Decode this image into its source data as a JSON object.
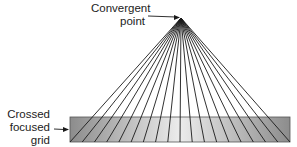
{
  "labels": {
    "convergent_line1": "Convergent",
    "convergent_line2": "point",
    "grid_line1": "Crossed",
    "grid_line2": "focused",
    "grid_line3": "grid"
  },
  "geometry": {
    "apex": [
      181,
      18
    ],
    "grid_rect": {
      "x": 70,
      "y": 117,
      "width": 220,
      "height": 25
    },
    "line_count": 19
  },
  "colors": {
    "line": "#1a1a1a",
    "grid_edge": "#8c8c8c",
    "grid_center": "#ececec",
    "grid_border": "#555555",
    "text": "#222222"
  }
}
